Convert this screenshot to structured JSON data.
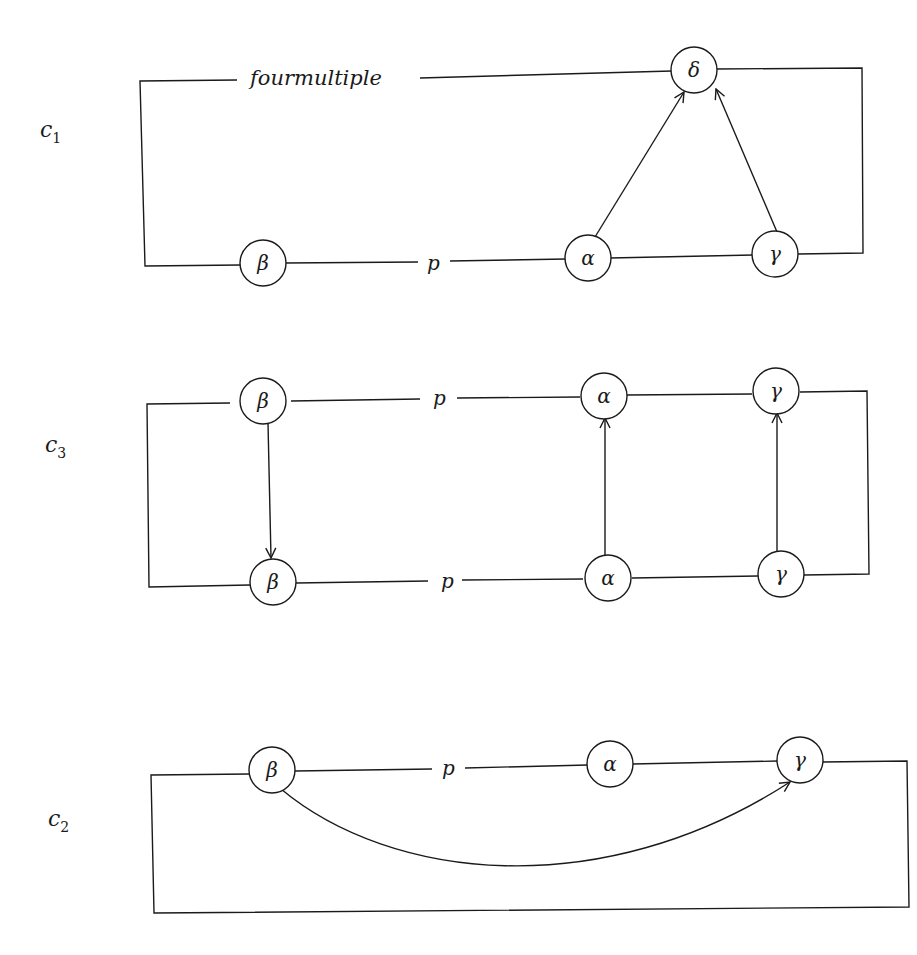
{
  "diagram": {
    "panels": [
      {
        "id": "c1",
        "label": "c",
        "subscript": "1",
        "edge_label": "fourmultiple",
        "strand_label": "p",
        "nodes": [
          {
            "name": "beta",
            "symbol": "β"
          },
          {
            "name": "alpha",
            "symbol": "α"
          },
          {
            "name": "gamma",
            "symbol": "γ"
          },
          {
            "name": "delta",
            "symbol": "δ"
          }
        ],
        "arrows": [
          {
            "from": "alpha",
            "to": "delta"
          },
          {
            "from": "gamma",
            "to": "delta"
          }
        ]
      },
      {
        "id": "c3",
        "label": "c",
        "subscript": "3",
        "top_strand_label": "p",
        "bottom_strand_label": "p",
        "top_nodes": [
          {
            "name": "beta",
            "symbol": "β"
          },
          {
            "name": "alpha",
            "symbol": "α"
          },
          {
            "name": "gamma",
            "symbol": "γ"
          }
        ],
        "bottom_nodes": [
          {
            "name": "beta",
            "symbol": "β"
          },
          {
            "name": "alpha",
            "symbol": "α"
          },
          {
            "name": "gamma",
            "symbol": "γ"
          }
        ],
        "arrows": [
          {
            "from": "top-beta",
            "to": "bottom-beta"
          },
          {
            "from": "bottom-alpha",
            "to": "top-alpha"
          },
          {
            "from": "bottom-gamma",
            "to": "top-gamma"
          }
        ]
      },
      {
        "id": "c2",
        "label": "c",
        "subscript": "2",
        "strand_label": "p",
        "nodes": [
          {
            "name": "beta",
            "symbol": "β"
          },
          {
            "name": "alpha",
            "symbol": "α"
          },
          {
            "name": "gamma",
            "symbol": "γ"
          }
        ],
        "arrows": [
          {
            "from": "beta",
            "to": "gamma",
            "curved": true
          }
        ]
      }
    ]
  }
}
